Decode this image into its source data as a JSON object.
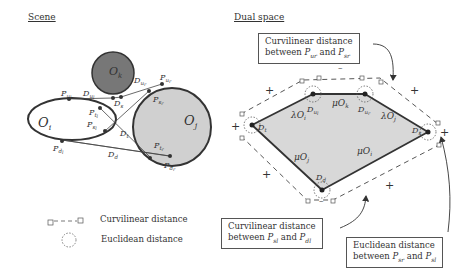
{
  "panels": {
    "scene": {
      "title": "Scene"
    },
    "dual": {
      "title": "Dual space"
    }
  },
  "scene": {
    "objects": [
      {
        "id": "Oi",
        "label": "O",
        "sub": "i",
        "shape": "ellipse",
        "fill": "#ffffff"
      },
      {
        "id": "Ok",
        "label": "O",
        "sub": "k",
        "shape": "circle",
        "fill": "#777777"
      },
      {
        "id": "Oj",
        "label": "O",
        "sub": "j",
        "shape": "circle",
        "fill": "#d0d0d0"
      }
    ],
    "points": [
      "P_ul",
      "P_ur",
      "P_sl",
      "P_sr",
      "P_tl",
      "P_tr",
      "P_dl",
      "P_dr"
    ],
    "edges": [
      "D_ul",
      "D_ur",
      "D_s",
      "D_t",
      "D_d"
    ]
  },
  "dual": {
    "nodes": [
      "D_t",
      "D_ul",
      "D_ur",
      "D_s",
      "D_d"
    ],
    "edge_labels": [
      "λO_i",
      "μO_k",
      "λO_j",
      "μO_j",
      "μO_i"
    ],
    "polygon_fill": "#d8d8d8"
  },
  "callouts": {
    "top": {
      "line1": "Curvilinear distance",
      "line2_pre": "between ",
      "p1": "P",
      "p1sub": "u",
      "p1sub2": "r",
      "and": " and ",
      "p2": "P",
      "p2sub": "s",
      "p2sub2": "r"
    },
    "bottom_left": {
      "line1": "Curvilinear distance",
      "line2_pre": "between ",
      "p1": "P",
      "p1sub": "s",
      "p1sub2": "l",
      "and": " and ",
      "p2": "P",
      "p2sub": "d",
      "p2sub2": "l"
    },
    "bottom_right": {
      "line1": "Euclidean distance",
      "line2_pre": "between ",
      "p1": "P",
      "p1sub": "s",
      "p1sub2": "r",
      "and": " and ",
      "p2": "P",
      "p2sub": "s",
      "p2sub2": "l"
    }
  },
  "legend": {
    "curvilinear": "Curvilinear distance",
    "euclidean": "Euclidean distance"
  }
}
